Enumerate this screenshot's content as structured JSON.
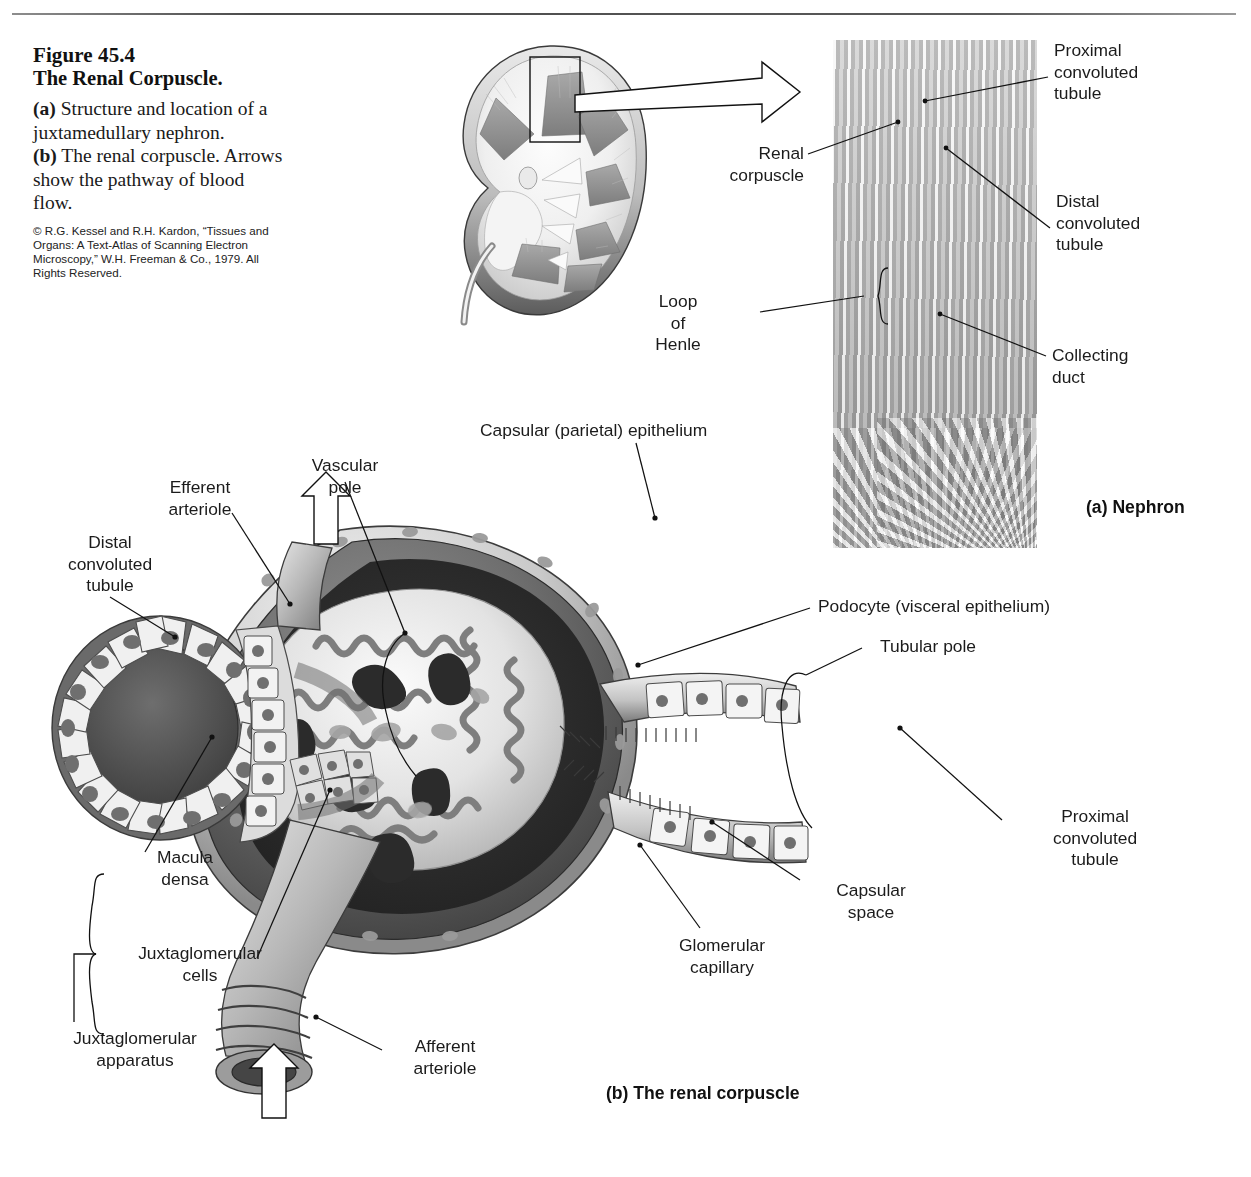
{
  "page": {
    "background": "#ffffff",
    "ink": "#1b1b1b",
    "top_rule": true
  },
  "caption": {
    "figure_number": "Figure 45.4",
    "figure_title": "The Renal Corpuscle.",
    "part_a_marker": "(a)",
    "part_a_text": " Structure and location of a juxtamedullary nephron.",
    "part_b_marker": "(b)",
    "part_b_text": " The renal corpuscle. Arrows show the pathway of blood flow.",
    "credit": "© R.G. Kessel and R.H. Kardon, “Tissues and Organs: A Text-Atlas of Scanning Electron Microscopy,” W.H. Freeman & Co., 1979. All Rights Reserved."
  },
  "panel_a": {
    "caption": "(a) Nephron",
    "labels": [
      {
        "id": "proximal-convoluted-tubule",
        "text": "Proximal\nconvoluted\ntubule",
        "align": "left"
      },
      {
        "id": "renal-corpuscle",
        "text": "Renal\ncorpuscle",
        "align": "right"
      },
      {
        "id": "distal-convoluted-tubule",
        "text": "Distal\nconvoluted\ntubule",
        "align": "left"
      },
      {
        "id": "loop-of-henle",
        "text": "Loop\nof\nHenle",
        "align": "center"
      },
      {
        "id": "collecting-duct",
        "text": "Collecting\nduct",
        "align": "left"
      }
    ]
  },
  "panel_b": {
    "caption": "(b) The renal corpuscle",
    "labels": [
      {
        "id": "capsular-parietal-epithelium",
        "text": "Capsular (parietal) epithelium"
      },
      {
        "id": "vascular-pole",
        "text": "Vascular\npole"
      },
      {
        "id": "efferent-arteriole",
        "text": "Efferent\narteriole"
      },
      {
        "id": "distal-convoluted-tubule",
        "text": "Distal\nconvoluted\ntubule"
      },
      {
        "id": "podocyte-visceral-epithelium",
        "text": "Podocyte (visceral epithelium)"
      },
      {
        "id": "tubular-pole",
        "text": "Tubular pole"
      },
      {
        "id": "proximal-convoluted-tubule",
        "text": "Proximal\nconvoluted\ntubule"
      },
      {
        "id": "capsular-space",
        "text": "Capsular\nspace"
      },
      {
        "id": "glomerular-capillary",
        "text": "Glomerular\ncapillary"
      },
      {
        "id": "macula-densa",
        "text": "Macula\ndensa"
      },
      {
        "id": "juxtaglomerular-cells",
        "text": "Juxtaglomerular\ncells"
      },
      {
        "id": "juxtaglomerular-apparatus",
        "text": "Juxtaglomerular\napparatus"
      },
      {
        "id": "afferent-arteriole",
        "text": "Afferent\narteriole"
      }
    ],
    "flow_arrows": [
      {
        "id": "efferent-outflow-arrow",
        "direction": "up"
      },
      {
        "id": "afferent-inflow-arrow",
        "direction": "up"
      }
    ]
  }
}
